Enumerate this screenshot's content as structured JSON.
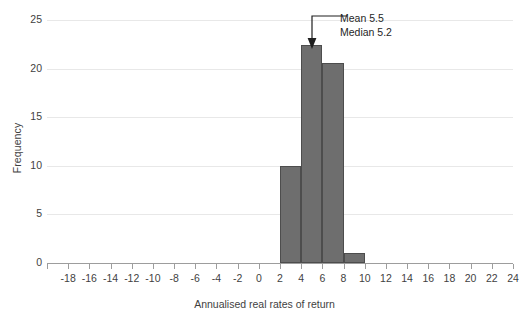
{
  "chart_data": {
    "type": "bar",
    "title": "",
    "xlabel": "Annualised real rates of return",
    "ylabel": "Frequency",
    "xlim": [
      -20,
      24
    ],
    "ylim": [
      0,
      25
    ],
    "grid": true,
    "legend": "none",
    "bin_width": 2,
    "categories": [
      "2 to 4",
      "4 to 6",
      "6 to 8",
      "8 to 10"
    ],
    "bin_edges": [
      2,
      4,
      6,
      8,
      10
    ],
    "values": [
      10,
      22.4,
      20.6,
      1
    ],
    "x_ticks": [
      {
        "value": -20,
        "label": ""
      },
      {
        "value": -18,
        "label": "-18"
      },
      {
        "value": -16,
        "label": "-16"
      },
      {
        "value": -14,
        "label": "-14"
      },
      {
        "value": -12,
        "label": "-12"
      },
      {
        "value": -10,
        "label": "-10"
      },
      {
        "value": -8,
        "label": "-8"
      },
      {
        "value": -6,
        "label": "-6"
      },
      {
        "value": -4,
        "label": "-4"
      },
      {
        "value": -2,
        "label": "-2"
      },
      {
        "value": 0,
        "label": "0"
      },
      {
        "value": 2,
        "label": "2"
      },
      {
        "value": 4,
        "label": "4"
      },
      {
        "value": 6,
        "label": "6"
      },
      {
        "value": 8,
        "label": "8"
      },
      {
        "value": 10,
        "label": "10"
      },
      {
        "value": 12,
        "label": "12"
      },
      {
        "value": 14,
        "label": "14"
      },
      {
        "value": 16,
        "label": "16"
      },
      {
        "value": 18,
        "label": "18"
      },
      {
        "value": 20,
        "label": "20"
      },
      {
        "value": 22,
        "label": "22"
      },
      {
        "value": 24,
        "label": "24"
      }
    ],
    "y_ticks": [
      {
        "value": 0,
        "label": "0"
      },
      {
        "value": 5,
        "label": "5"
      },
      {
        "value": 10,
        "label": "10"
      },
      {
        "value": 15,
        "label": "15"
      },
      {
        "value": 20,
        "label": "20"
      },
      {
        "value": 25,
        "label": "25"
      }
    ],
    "annotations": [
      {
        "name": "mean",
        "text": "Mean 5.5",
        "points_to_x": 5.0
      },
      {
        "name": "median",
        "text": "Median 5.2",
        "points_to_x": 5.0
      }
    ],
    "colors": {
      "bar_fill": "#6e6e6e",
      "bar_stroke": "#4d4d4d",
      "gridline": "#e8e8e8",
      "axis": "#9d9d9d",
      "text": "#3f3f3f",
      "annotation_text": "#1f1f1f",
      "background": "#ffffff"
    }
  }
}
